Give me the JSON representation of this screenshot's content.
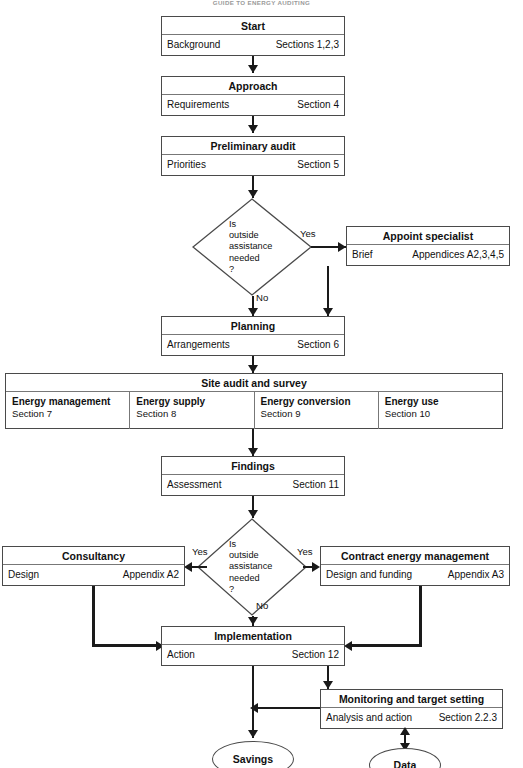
{
  "page": {
    "running_head": "GUIDE TO ENERGY AUDITING",
    "width": 523,
    "height": 768,
    "line_color": "#1a1a1a",
    "border_color": "#4a4a4a",
    "background": "#ffffff"
  },
  "nodes": {
    "start": {
      "title": "Start",
      "left": "Background",
      "right": "Sections 1,2,3"
    },
    "approach": {
      "title": "Approach",
      "left": "Requirements",
      "right": "Section 4"
    },
    "preliminary": {
      "title": "Preliminary audit",
      "left": "Priorities",
      "right": "Section 5"
    },
    "specialist": {
      "title": "Appoint specialist",
      "left": "Brief",
      "right": "Appendices A2,3,4,5"
    },
    "planning": {
      "title": "Planning",
      "left": "Arrangements",
      "right": "Section 6"
    },
    "findings": {
      "title": "Findings",
      "left": "Assessment",
      "right": "Section 11"
    },
    "consultancy": {
      "title": "Consultancy",
      "left": "Design",
      "right": "Appendix A2"
    },
    "contract": {
      "title": "Contract energy management",
      "left": "Design and funding",
      "right": "Appendix A3"
    },
    "implementation": {
      "title": "Implementation",
      "left": "Action",
      "right": "Section 12"
    },
    "monitoring": {
      "title": "Monitoring and target setting",
      "left": "Analysis and action",
      "right": "Section 2.2.3"
    }
  },
  "audit": {
    "title": "Site audit and survey",
    "columns": [
      {
        "title": "Energy management",
        "sub": "Section 7"
      },
      {
        "title": "Energy supply",
        "sub": "Section 8"
      },
      {
        "title": "Energy conversion",
        "sub": "Section 9"
      },
      {
        "title": "Energy use",
        "sub": "Section 10"
      }
    ]
  },
  "decisions": {
    "first": {
      "text": "Is\noutside\nassistance\nneeded\n?"
    },
    "second": {
      "text": "Is\noutside\nassistance\nneeded\n?"
    }
  },
  "terminators": {
    "savings": {
      "label": "Savings"
    },
    "data": {
      "label": "Data"
    }
  },
  "edge_labels": {
    "yes_1": "Yes",
    "no_1": "No",
    "yes_2a": "Yes",
    "yes_2b": "Yes",
    "no_2": "No"
  }
}
